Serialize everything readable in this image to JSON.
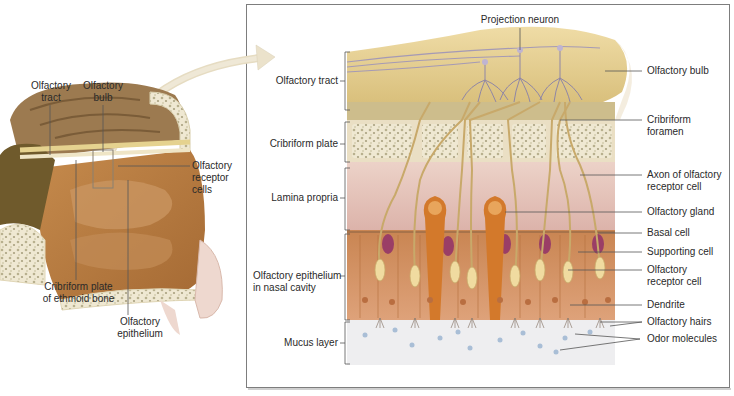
{
  "figure": {
    "colors": {
      "bulb": "#e6cf92",
      "bone": "#f1ead4",
      "lamina": "#e6c4bc",
      "epithelium": "#d89a68",
      "basal_cell": "#9a3e66",
      "receptor_cell": "#f0dba0",
      "gland": "#d3792b",
      "mucus": "#eeeef0",
      "odor": "#a9bed6",
      "frame": "#8a8a8a",
      "arrow": "#e9e0c8",
      "nasal_tissue": "#b97a3e",
      "brain": "#8a6a44"
    }
  },
  "sagittal_view": {
    "labels": {
      "olfactory_tract": [
        "Olfactory",
        "tract"
      ],
      "olfactory_bulb": [
        "Olfactory",
        "bulb"
      ],
      "olfactory_receptor_cells": [
        "Olfactory",
        "receptor",
        "cells"
      ],
      "cribriform_plate": [
        "Cribriform plate",
        "of ethmoid bone"
      ],
      "olfactory_epithelium": [
        "Olfactory",
        "epithelium"
      ]
    }
  },
  "detail_view": {
    "top_label": "Projection neuron",
    "left_labels": {
      "olfactory_tract": "Olfactory tract",
      "cribriform_plate": "Cribriform plate",
      "lamina_propria": "Lamina propria",
      "olfactory_epithelium": [
        "Olfactory epithelium",
        "in nasal cavity"
      ],
      "mucus_layer": "Mucus layer"
    },
    "right_labels": {
      "olfactory_bulb": "Olfactory bulb",
      "cribriform_foramen": [
        "Cribriform",
        "foramen"
      ],
      "axon": [
        "Axon of olfactory",
        "receptor cell"
      ],
      "olfactory_gland": "Olfactory gland",
      "basal_cell": "Basal cell",
      "supporting_cell": "Supporting cell",
      "olfactory_receptor_cell": [
        "Olfactory",
        "receptor cell"
      ],
      "dendrite": "Dendrite",
      "olfactory_hairs": "Olfactory hairs",
      "odor_molecules": "Odor molecules"
    }
  }
}
